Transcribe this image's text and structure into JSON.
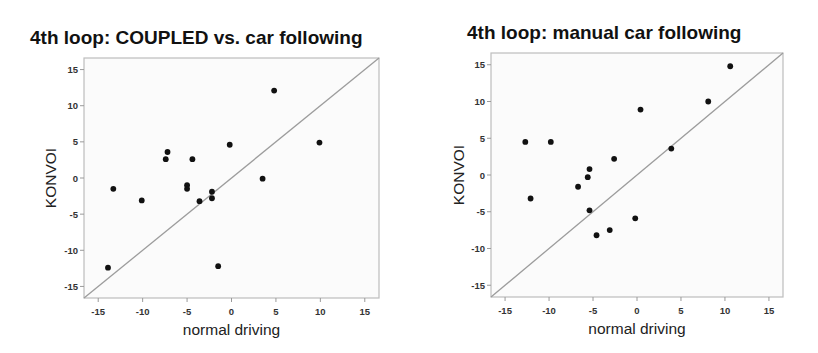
{
  "chart_data": [
    {
      "type": "scatter",
      "title": "4th loop: COUPLED vs. car following",
      "xlabel": "normal driving",
      "ylabel": "KONVOI",
      "xlim": [
        -16.6,
        16.6
      ],
      "ylim": [
        -16.6,
        16.6
      ],
      "xticks": [
        -15,
        -10,
        -5,
        0,
        5,
        10,
        15
      ],
      "yticks": [
        -15,
        -10,
        -5,
        0,
        5,
        10,
        15
      ],
      "grid": false,
      "reference_line": "y = x",
      "points": [
        {
          "x": -0.2,
          "y": 4.6
        },
        {
          "x": -7.2,
          "y": 3.6
        },
        {
          "x": -7.4,
          "y": 2.6
        },
        {
          "x": -4.4,
          "y": 2.6
        },
        {
          "x": -13.3,
          "y": -1.5
        },
        {
          "x": -5.0,
          "y": -1.0
        },
        {
          "x": -5.0,
          "y": -1.5
        },
        {
          "x": -10.1,
          "y": -3.1
        },
        {
          "x": -3.6,
          "y": -3.2
        },
        {
          "x": -2.2,
          "y": -1.9
        },
        {
          "x": -2.2,
          "y": -2.8
        },
        {
          "x": 4.8,
          "y": 12.1
        },
        {
          "x": 9.9,
          "y": 4.9
        },
        {
          "x": 3.5,
          "y": -0.1
        },
        {
          "x": -13.9,
          "y": -12.4
        },
        {
          "x": -1.5,
          "y": -12.2
        }
      ]
    },
    {
      "type": "scatter",
      "title": "4th loop: manual car following",
      "xlabel": "normal driving",
      "ylabel": "KONVOI",
      "xlim": [
        -16.6,
        16.6
      ],
      "ylim": [
        -16.6,
        16.6
      ],
      "xticks": [
        -15,
        -10,
        -5,
        0,
        5,
        10,
        15
      ],
      "yticks": [
        -15,
        -10,
        -5,
        0,
        5,
        10,
        15
      ],
      "grid": false,
      "reference_line": "y = x",
      "points": [
        {
          "x": 10.6,
          "y": 14.8
        },
        {
          "x": 8.1,
          "y": 10.0
        },
        {
          "x": 0.4,
          "y": 8.9
        },
        {
          "x": -12.7,
          "y": 4.5
        },
        {
          "x": -9.8,
          "y": 4.5
        },
        {
          "x": 3.9,
          "y": 3.6
        },
        {
          "x": -2.6,
          "y": 2.2
        },
        {
          "x": -5.4,
          "y": 0.8
        },
        {
          "x": -5.6,
          "y": -0.3
        },
        {
          "x": -6.7,
          "y": -1.6
        },
        {
          "x": -12.1,
          "y": -3.2
        },
        {
          "x": -5.4,
          "y": -4.8
        },
        {
          "x": -0.2,
          "y": -5.9
        },
        {
          "x": -3.1,
          "y": -7.5
        },
        {
          "x": -4.6,
          "y": -8.2
        }
      ]
    }
  ],
  "plots": [
    {
      "title": "4th loop: COUPLED vs. car following",
      "xlabel": "normal driving",
      "ylabel": "KONVOI"
    },
    {
      "title": "4th loop: manual car following",
      "xlabel": "normal driving",
      "ylabel": "KONVOI"
    }
  ],
  "colors": {
    "point": "#111111",
    "reference_line": "#9c9c9c",
    "frame": "#bdbdbd",
    "plot_background": "#fbfbfb"
  }
}
